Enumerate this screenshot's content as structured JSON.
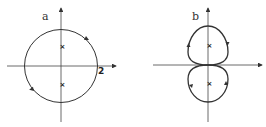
{
  "panels": [
    {
      "label": "a",
      "tick_label": "2",
      "description": "circular contour of radius 2 enclosing two poles on imaginary axis"
    },
    {
      "label": "b",
      "description": "figure-eight contour with two lobes each enclosing a pole"
    }
  ],
  "colors": {
    "stroke": "#333333",
    "background": "#ffffff"
  }
}
